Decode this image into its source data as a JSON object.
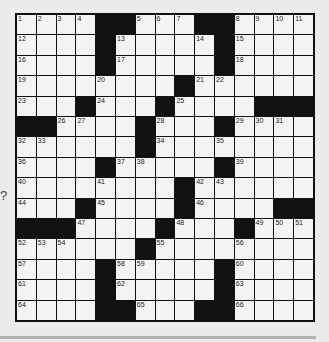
{
  "puzzle": {
    "rows": 15,
    "cols": 15,
    "side_mark": "?",
    "colors": {
      "black": "#111111",
      "cell": "#f3f3f3",
      "background": "#ebebeb"
    },
    "layout": [
      "....##...##....",
      "....#.....#....",
      "....#.....#....",
      "........#......",
      "...#...#....###",
      "##....#...#....",
      "......#........",
      "....#.....#....",
      "........#......",
      "...#....#....##",
      "###....#...#...",
      "......#........",
      "....#.....#....",
      "....#.....#....",
      "....##...##...."
    ],
    "numbers": [
      [
        0,
        0,
        1
      ],
      [
        0,
        1,
        2
      ],
      [
        0,
        2,
        3
      ],
      [
        0,
        3,
        4
      ],
      [
        0,
        6,
        5
      ],
      [
        0,
        7,
        6
      ],
      [
        0,
        8,
        7
      ],
      [
        0,
        11,
        8
      ],
      [
        0,
        12,
        9
      ],
      [
        0,
        13,
        10
      ],
      [
        0,
        14,
        11
      ],
      [
        1,
        0,
        12
      ],
      [
        1,
        5,
        13
      ],
      [
        1,
        9,
        14
      ],
      [
        1,
        11,
        15
      ],
      [
        2,
        0,
        16
      ],
      [
        2,
        5,
        17
      ],
      [
        2,
        11,
        18
      ],
      [
        3,
        0,
        19
      ],
      [
        3,
        4,
        20
      ],
      [
        3,
        9,
        21
      ],
      [
        3,
        10,
        22
      ],
      [
        4,
        0,
        23
      ],
      [
        4,
        4,
        24
      ],
      [
        4,
        8,
        25
      ],
      [
        5,
        2,
        26
      ],
      [
        5,
        3,
        27
      ],
      [
        5,
        7,
        28
      ],
      [
        5,
        11,
        29
      ],
      [
        5,
        12,
        30
      ],
      [
        5,
        13,
        31
      ],
      [
        6,
        0,
        32
      ],
      [
        6,
        1,
        33
      ],
      [
        6,
        7,
        34
      ],
      [
        6,
        10,
        35
      ],
      [
        7,
        0,
        36
      ],
      [
        7,
        5,
        37
      ],
      [
        7,
        6,
        38
      ],
      [
        7,
        11,
        39
      ],
      [
        8,
        0,
        40
      ],
      [
        8,
        4,
        41
      ],
      [
        8,
        9,
        42
      ],
      [
        8,
        10,
        43
      ],
      [
        9,
        0,
        44
      ],
      [
        9,
        4,
        45
      ],
      [
        9,
        9,
        46
      ],
      [
        10,
        3,
        47
      ],
      [
        10,
        8,
        48
      ],
      [
        10,
        12,
        49
      ],
      [
        10,
        13,
        50
      ],
      [
        10,
        14,
        51
      ],
      [
        11,
        0,
        52
      ],
      [
        11,
        1,
        53
      ],
      [
        11,
        2,
        54
      ],
      [
        11,
        7,
        55
      ],
      [
        11,
        11,
        56
      ],
      [
        12,
        0,
        57
      ],
      [
        12,
        5,
        58
      ],
      [
        12,
        6,
        59
      ],
      [
        12,
        11,
        60
      ],
      [
        13,
        0,
        61
      ],
      [
        13,
        5,
        62
      ],
      [
        13,
        11,
        63
      ],
      [
        14,
        0,
        64
      ],
      [
        14,
        6,
        65
      ],
      [
        14,
        11,
        66
      ]
    ]
  }
}
